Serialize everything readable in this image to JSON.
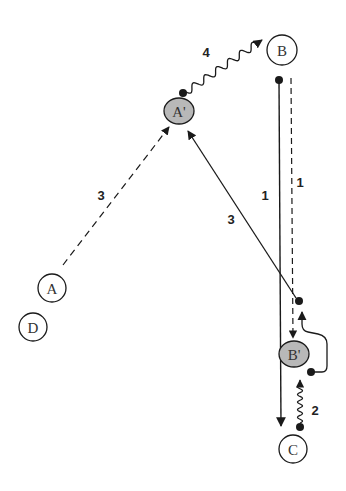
{
  "diagram": {
    "nodes": [
      {
        "id": "B",
        "label": "B",
        "shape": "circle",
        "fill": "#ffffff"
      },
      {
        "id": "A_prime",
        "label": "A'",
        "shape": "ellipse",
        "fill": "#b8b8b8"
      },
      {
        "id": "A",
        "label": "A",
        "shape": "circle",
        "fill": "#ffffff"
      },
      {
        "id": "D",
        "label": "D",
        "shape": "circle",
        "fill": "#ffffff"
      },
      {
        "id": "B_prime",
        "label": "B'",
        "shape": "ellipse",
        "fill": "#b8b8b8"
      },
      {
        "id": "C",
        "label": "C",
        "shape": "circle",
        "fill": "#ffffff"
      }
    ],
    "edges": [
      {
        "id": "e_Aprime_B",
        "from": "A'",
        "to": "B",
        "style": "wavy",
        "label": "4"
      },
      {
        "id": "e_B_C",
        "from": "B",
        "to": "C",
        "style": "solid",
        "label": "1"
      },
      {
        "id": "e_B_Bprime",
        "from": "B",
        "to": "B'",
        "style": "dashed",
        "label": "1"
      },
      {
        "id": "e_A_Aprime",
        "from": "A",
        "to": "A'",
        "style": "dashed",
        "label": "3"
      },
      {
        "id": "e_Bprime_Aprime",
        "from": "B'",
        "to": "A'",
        "style": "solid",
        "label": "3"
      },
      {
        "id": "e_C_Bprime",
        "from": "C",
        "to": "B'",
        "style": "wavy",
        "label": "2"
      },
      {
        "id": "e_Bprime_loop",
        "from": "B'",
        "to": "B'",
        "style": "curved",
        "label": ""
      }
    ],
    "colors": {
      "stroke": "#1a1a1a",
      "shaded_node": "#b8b8b8"
    }
  }
}
